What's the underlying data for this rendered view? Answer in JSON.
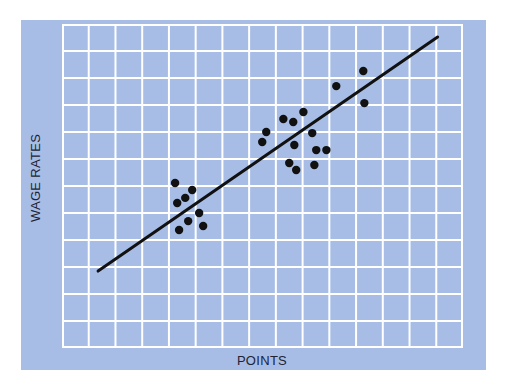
{
  "chart_data": {
    "type": "scatter",
    "title": "",
    "xlabel": "POINTS",
    "ylabel": "WAGE RATES",
    "grid": true,
    "grid_columns": 15,
    "grid_rows": 12,
    "xlim": [
      0,
      15
    ],
    "ylim": [
      0,
      12
    ],
    "tick_labels": {
      "x": [],
      "y": []
    },
    "legend": null,
    "colors": {
      "panel": "#a7bde6",
      "grid_lines": "#ffffff",
      "points": "#111111",
      "trend_line": "#111111"
    },
    "series": [
      {
        "name": "data points",
        "points": [
          {
            "x": 4.23,
            "y": 6.11
          },
          {
            "x": 4.87,
            "y": 5.85
          },
          {
            "x": 4.61,
            "y": 5.56
          },
          {
            "x": 4.31,
            "y": 5.37
          },
          {
            "x": 5.13,
            "y": 5.0
          },
          {
            "x": 4.72,
            "y": 4.7
          },
          {
            "x": 4.38,
            "y": 4.37
          },
          {
            "x": 5.28,
            "y": 4.52
          },
          {
            "x": 8.28,
            "y": 8.48
          },
          {
            "x": 8.65,
            "y": 8.37
          },
          {
            "x": 9.03,
            "y": 8.74
          },
          {
            "x": 7.64,
            "y": 8.0
          },
          {
            "x": 7.49,
            "y": 7.63
          },
          {
            "x": 9.36,
            "y": 7.96
          },
          {
            "x": 8.69,
            "y": 7.52
          },
          {
            "x": 9.51,
            "y": 7.33
          },
          {
            "x": 9.89,
            "y": 7.33
          },
          {
            "x": 8.5,
            "y": 6.85
          },
          {
            "x": 8.76,
            "y": 6.59
          },
          {
            "x": 9.44,
            "y": 6.78
          },
          {
            "x": 10.26,
            "y": 9.7
          },
          {
            "x": 11.27,
            "y": 10.26
          },
          {
            "x": 11.31,
            "y": 9.07
          }
        ]
      }
    ],
    "trend_line": {
      "x": [
        1.35,
        14.05
      ],
      "y": [
        2.85,
        11.52
      ]
    }
  },
  "labels": {
    "x_axis": "POINTS",
    "y_axis": "WAGE RATES"
  }
}
